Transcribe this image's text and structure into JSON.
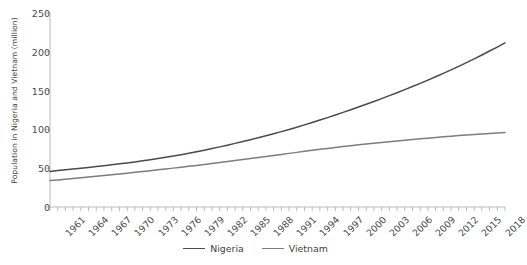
{
  "chart_data": {
    "type": "line",
    "title": "",
    "xlabel": "",
    "ylabel": "Population in Nigeria and Vietnam (million)",
    "xlim": [
      1961,
      2020
    ],
    "ylim": [
      0,
      250
    ],
    "yticks": [
      0,
      50,
      100,
      150,
      200,
      250
    ],
    "ytick_labels": [
      "0",
      "50",
      "100",
      "150",
      "200",
      "250"
    ],
    "xtick_labels": [
      "1961",
      "1964",
      "1967",
      "1970",
      "1973",
      "1976",
      "1979",
      "1982",
      "1985",
      "1988",
      "1991",
      "1994",
      "1997",
      "2000",
      "2003",
      "2006",
      "2009",
      "2012",
      "2015",
      "2018"
    ],
    "xticks": [
      1961,
      1964,
      1967,
      1970,
      1973,
      1976,
      1979,
      1982,
      1985,
      1988,
      1991,
      1994,
      1997,
      2000,
      2003,
      2006,
      2009,
      2012,
      2015,
      2018
    ],
    "x": [
      1961,
      1962,
      1963,
      1964,
      1965,
      1966,
      1967,
      1968,
      1969,
      1970,
      1971,
      1972,
      1973,
      1974,
      1975,
      1976,
      1977,
      1978,
      1979,
      1980,
      1981,
      1982,
      1983,
      1984,
      1985,
      1986,
      1987,
      1988,
      1989,
      1990,
      1991,
      1992,
      1993,
      1994,
      1995,
      1996,
      1997,
      1998,
      1999,
      2000,
      2001,
      2002,
      2003,
      2004,
      2005,
      2006,
      2007,
      2008,
      2009,
      2010,
      2011,
      2012,
      2013,
      2014,
      2015,
      2016,
      2017,
      2018,
      2019,
      2020
    ],
    "grid": false,
    "legend_position": "bottom-center",
    "series": [
      {
        "name": "Nigeria",
        "color": "#4a4a4a",
        "values": [
          45.9,
          46.9,
          47.9,
          48.9,
          50.0,
          51.0,
          52.1,
          53.2,
          54.4,
          55.6,
          56.8,
          58.1,
          59.5,
          60.9,
          62.4,
          64.0,
          65.7,
          67.4,
          69.3,
          71.2,
          73.2,
          75.3,
          77.5,
          79.7,
          82.0,
          84.3,
          86.7,
          89.2,
          91.7,
          94.4,
          97.1,
          99.9,
          102.8,
          105.8,
          108.9,
          112.0,
          115.2,
          118.5,
          121.9,
          125.3,
          128.8,
          132.4,
          136.0,
          139.7,
          143.5,
          147.3,
          151.2,
          155.2,
          159.3,
          163.5,
          167.8,
          172.2,
          176.7,
          181.3,
          186.0,
          190.9,
          195.9,
          201.0,
          206.1,
          211.4
        ]
      },
      {
        "name": "Vietnam",
        "color": "#7d7d7d",
        "values": [
          34.0,
          34.9,
          35.9,
          36.8,
          37.8,
          38.7,
          39.7,
          40.6,
          41.6,
          42.6,
          43.6,
          44.7,
          45.7,
          46.8,
          47.9,
          49.0,
          50.1,
          51.2,
          52.4,
          53.6,
          54.8,
          56.0,
          57.3,
          58.6,
          59.9,
          61.2,
          62.5,
          63.8,
          65.1,
          66.4,
          67.7,
          69.1,
          70.4,
          71.7,
          73.0,
          74.3,
          75.5,
          76.7,
          77.9,
          79.0,
          80.1,
          81.1,
          82.1,
          83.1,
          84.1,
          85.1,
          86.0,
          86.9,
          87.8,
          88.7,
          89.6,
          90.4,
          91.2,
          92.0,
          92.7,
          93.4,
          94.1,
          94.7,
          95.3,
          95.9
        ]
      }
    ]
  },
  "legend": {
    "items": [
      {
        "label": "Nigeria"
      },
      {
        "label": "Vietnam"
      }
    ]
  }
}
